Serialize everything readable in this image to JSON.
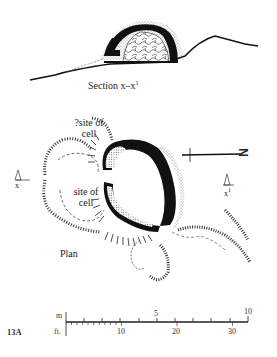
{
  "figure": {
    "number": "13A",
    "section_label": "Section x–x",
    "section_label_sup": "1",
    "plan_label": "Plan",
    "cell_labels": [
      {
        "line1": "?site of",
        "line2": "cell"
      },
      {
        "line1": "site of",
        "line2": "cell"
      }
    ],
    "section_markers": {
      "left": "x",
      "right": "x",
      "right_sup": "1"
    },
    "north_arrow": {
      "label": "N",
      "orientation": "pointing right (east on page)"
    }
  },
  "scale_bar": {
    "metric_unit": "m",
    "imperial_unit": "ft.",
    "metric_ticks": [
      "5",
      "10"
    ],
    "imperial_ticks": [
      "10",
      "20",
      "30"
    ]
  },
  "colors": {
    "ink": "#111111",
    "stipple": "#8a8a8a",
    "paper": "#ffffff"
  }
}
